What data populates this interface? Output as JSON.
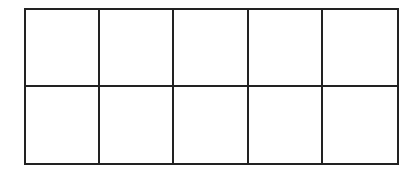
{
  "diagram": {
    "type": "grid",
    "rows": 2,
    "columns": 5,
    "line_color": "#222222",
    "fill_color": "#ffffff",
    "cells": [
      {
        "row": 1,
        "col": 1,
        "label": ""
      },
      {
        "row": 1,
        "col": 2,
        "label": ""
      },
      {
        "row": 1,
        "col": 3,
        "label": ""
      },
      {
        "row": 1,
        "col": 4,
        "label": ""
      },
      {
        "row": 1,
        "col": 5,
        "label": ""
      },
      {
        "row": 2,
        "col": 1,
        "label": ""
      },
      {
        "row": 2,
        "col": 2,
        "label": ""
      },
      {
        "row": 2,
        "col": 3,
        "label": ""
      },
      {
        "row": 2,
        "col": 4,
        "label": ""
      },
      {
        "row": 2,
        "col": 5,
        "label": ""
      }
    ]
  }
}
